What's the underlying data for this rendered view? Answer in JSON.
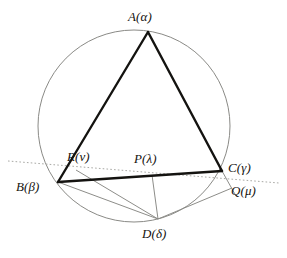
{
  "figure": {
    "type": "euclidean-geometry-diagram",
    "background_color": "#ffffff",
    "stroke_colors": {
      "circle": "#8a8a86",
      "triangle": "#141310",
      "thin_line": "#8d8d89",
      "dotted_line": "#a9a9a5"
    },
    "labels": [
      {
        "id": "A",
        "text": "A(α)",
        "x": 128,
        "y": 10
      },
      {
        "id": "B",
        "text": "B(β)",
        "x": 16,
        "y": 180
      },
      {
        "id": "C",
        "text": "C(γ)",
        "x": 228,
        "y": 161
      },
      {
        "id": "D",
        "text": "D(δ)",
        "x": 142,
        "y": 227
      },
      {
        "id": "P",
        "text": "P(λ)",
        "x": 134,
        "y": 152
      },
      {
        "id": "Q",
        "text": "Q(μ)",
        "x": 231,
        "y": 184
      },
      {
        "id": "R",
        "text": "R(ν)",
        "x": 67,
        "y": 150
      }
    ],
    "points": {
      "A": {
        "x": 148,
        "y": 32
      },
      "B": {
        "x": 58,
        "y": 182
      },
      "C": {
        "x": 222,
        "y": 171
      },
      "D": {
        "x": 158,
        "y": 219
      },
      "P": {
        "x": 152,
        "y": 175
      },
      "Q": {
        "x": 232,
        "y": 188
      },
      "R": {
        "x": 76,
        "y": 170
      }
    },
    "circle": {
      "cx": 134,
      "cy": 126,
      "r": 96
    },
    "dotted_line": {
      "x1": 8,
      "y1": 161,
      "x2": 279,
      "y2": 183
    },
    "segments": [
      {
        "name": "side-AB",
        "from": "A",
        "to": "B",
        "weight": "thick"
      },
      {
        "name": "side-AC",
        "from": "A",
        "to": "C",
        "weight": "thick"
      },
      {
        "name": "side-BC",
        "from": "B",
        "to": "C",
        "weight": "thick"
      },
      {
        "name": "segment-BD",
        "from": "B",
        "to": "D",
        "weight": "thin"
      },
      {
        "name": "segment-RD",
        "from": "R",
        "to": "D",
        "weight": "thin"
      },
      {
        "name": "segment-PD",
        "from": "P",
        "to": "D",
        "weight": "thin"
      },
      {
        "name": "segment-DQ",
        "from": "D",
        "to": "Q",
        "weight": "thin"
      },
      {
        "name": "segment-CQ",
        "from": "C",
        "to": "Q",
        "weight": "thin"
      }
    ]
  }
}
